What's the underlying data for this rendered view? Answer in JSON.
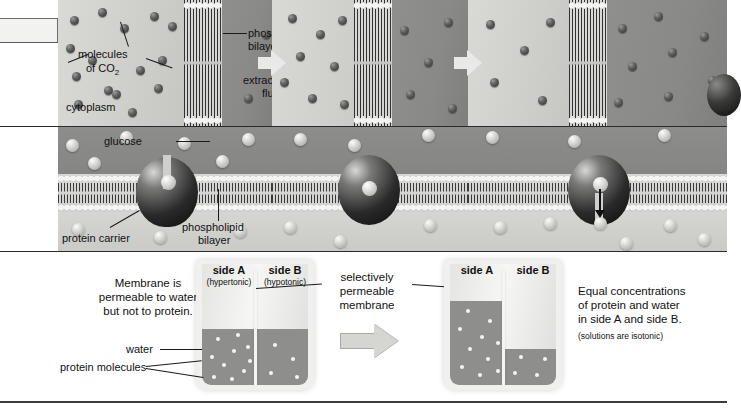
{
  "figure": {
    "panel_diffusion": {
      "labels": {
        "molecules_co2": "molecules\nof CO2",
        "molecules_line1": "molecules",
        "molecules_line2": "of CO",
        "molecules_sub": "2",
        "cytoplasm": "cytoplasm",
        "phospholipid_bilayer_line1": "phospholipid",
        "phospholipid_bilayer_line2": "bilayer",
        "extracellular_line1": "extracellular",
        "extracellular_line2": "fluid"
      }
    },
    "panel_facilitated": {
      "labels": {
        "glucose": "glucose",
        "protein_carrier": "protein carrier",
        "phospholipid_bilayer_line1": "phospholipid",
        "phospholipid_bilayer_line2": "bilayer"
      }
    },
    "panel_osmosis": {
      "left_caption": {
        "line1": "Membrane is",
        "line2": "permeable to water",
        "line3": "but not to protein."
      },
      "water_label": "water",
      "protein_label": "protein molecules",
      "membrane_label": {
        "line1": "selectively",
        "line2": "permeable",
        "line3": "membrane"
      },
      "beaker_before": {
        "side_a": "side A",
        "side_a_sub": "(hypertonic)",
        "side_b": "side B",
        "side_b_sub": "(hypotonic)"
      },
      "beaker_after": {
        "side_a": "side A",
        "side_b": "side B"
      },
      "right_caption": {
        "line1": "Equal concentrations",
        "line2": "of protein and water",
        "line3": "in side A and side B.",
        "line4": "(solutions are isotonic)"
      }
    },
    "colors": {
      "cytoplasm": "#d2d2cf",
      "extracellular_fluid": "#8a8a88",
      "water": "#8e8e8c",
      "carrier_protein": "#141414",
      "text": "#111111"
    }
  }
}
